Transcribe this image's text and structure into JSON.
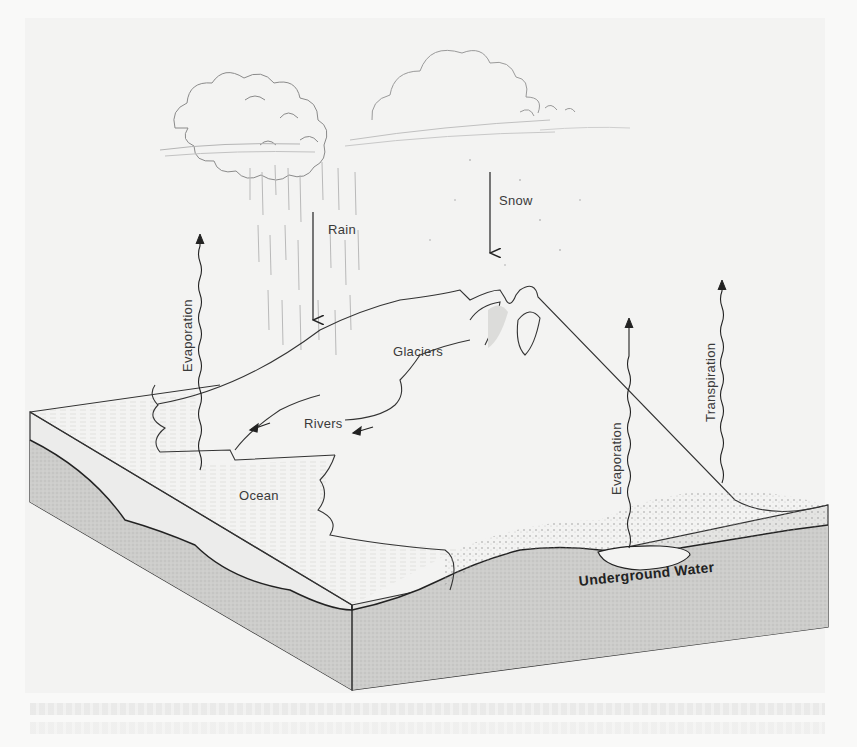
{
  "figure": {
    "labels": {
      "rain": "Rain",
      "snow": "Snow",
      "evaporation_ocean": "Evaporation",
      "glaciers": "Glaciers",
      "rivers": "Rivers",
      "ocean": "Ocean",
      "evaporation_land": "Evaporation",
      "transpiration": "Transpiration",
      "underground_water": "Underground Water"
    },
    "colors": {
      "paper": "#f9f9f8",
      "sky": "#f3f3f2",
      "ink": "#2a2a2a",
      "block_side": "#cfcfcd",
      "block_top_edge": "#e9e9e7"
    }
  }
}
